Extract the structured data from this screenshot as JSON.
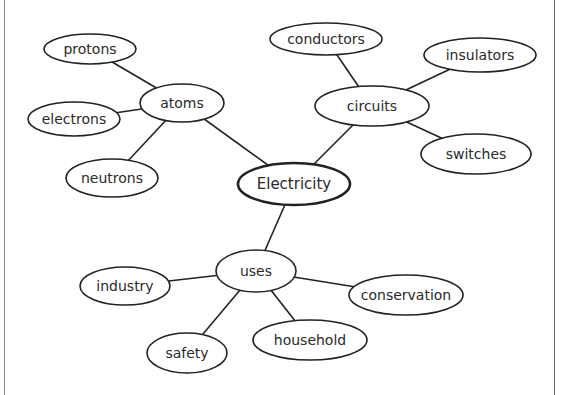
{
  "diagram": {
    "type": "concept-map",
    "colors": {
      "stroke": "#222222",
      "fill": "#ffffff",
      "text": "#2a2a2a",
      "frame_left": "#8a8a8a",
      "frame_right": "#6a6a6a"
    },
    "center": {
      "id": "electricity",
      "label": "Electricity",
      "cx": 294,
      "cy": 184,
      "rx": 56,
      "ry": 21
    },
    "nodes": [
      {
        "id": "atoms",
        "label": "atoms",
        "cx": 182,
        "cy": 103,
        "rx": 42,
        "ry": 19
      },
      {
        "id": "protons",
        "label": "protons",
        "cx": 90,
        "cy": 49,
        "rx": 46,
        "ry": 15
      },
      {
        "id": "electrons",
        "label": "electrons",
        "cx": 74,
        "cy": 119,
        "rx": 46,
        "ry": 17
      },
      {
        "id": "neutrons",
        "label": "neutrons",
        "cx": 112,
        "cy": 178,
        "rx": 46,
        "ry": 19
      },
      {
        "id": "circuits",
        "label": "circuits",
        "cx": 372,
        "cy": 106,
        "rx": 57,
        "ry": 20
      },
      {
        "id": "conductors",
        "label": "conductors",
        "cx": 326,
        "cy": 39,
        "rx": 56,
        "ry": 16
      },
      {
        "id": "insulators",
        "label": "insulators",
        "cx": 480,
        "cy": 55,
        "rx": 56,
        "ry": 17
      },
      {
        "id": "switches",
        "label": "switches",
        "cx": 476,
        "cy": 154,
        "rx": 55,
        "ry": 20
      },
      {
        "id": "uses",
        "label": "uses",
        "cx": 256,
        "cy": 271,
        "rx": 40,
        "ry": 21
      },
      {
        "id": "industry",
        "label": "industry",
        "cx": 125,
        "cy": 286,
        "rx": 45,
        "ry": 19
      },
      {
        "id": "safety",
        "label": "safety",
        "cx": 187,
        "cy": 353,
        "rx": 40,
        "ry": 20
      },
      {
        "id": "household",
        "label": "household",
        "cx": 310,
        "cy": 340,
        "rx": 57,
        "ry": 20
      },
      {
        "id": "conservation",
        "label": "conservation",
        "cx": 406,
        "cy": 295,
        "rx": 57,
        "ry": 20
      }
    ],
    "edges": [
      {
        "from": "electricity",
        "to": "atoms"
      },
      {
        "from": "electricity",
        "to": "circuits"
      },
      {
        "from": "electricity",
        "to": "uses"
      },
      {
        "from": "atoms",
        "to": "protons"
      },
      {
        "from": "atoms",
        "to": "electrons"
      },
      {
        "from": "atoms",
        "to": "neutrons"
      },
      {
        "from": "circuits",
        "to": "conductors"
      },
      {
        "from": "circuits",
        "to": "insulators"
      },
      {
        "from": "circuits",
        "to": "switches"
      },
      {
        "from": "uses",
        "to": "industry"
      },
      {
        "from": "uses",
        "to": "safety"
      },
      {
        "from": "uses",
        "to": "household"
      },
      {
        "from": "uses",
        "to": "conservation"
      }
    ]
  }
}
